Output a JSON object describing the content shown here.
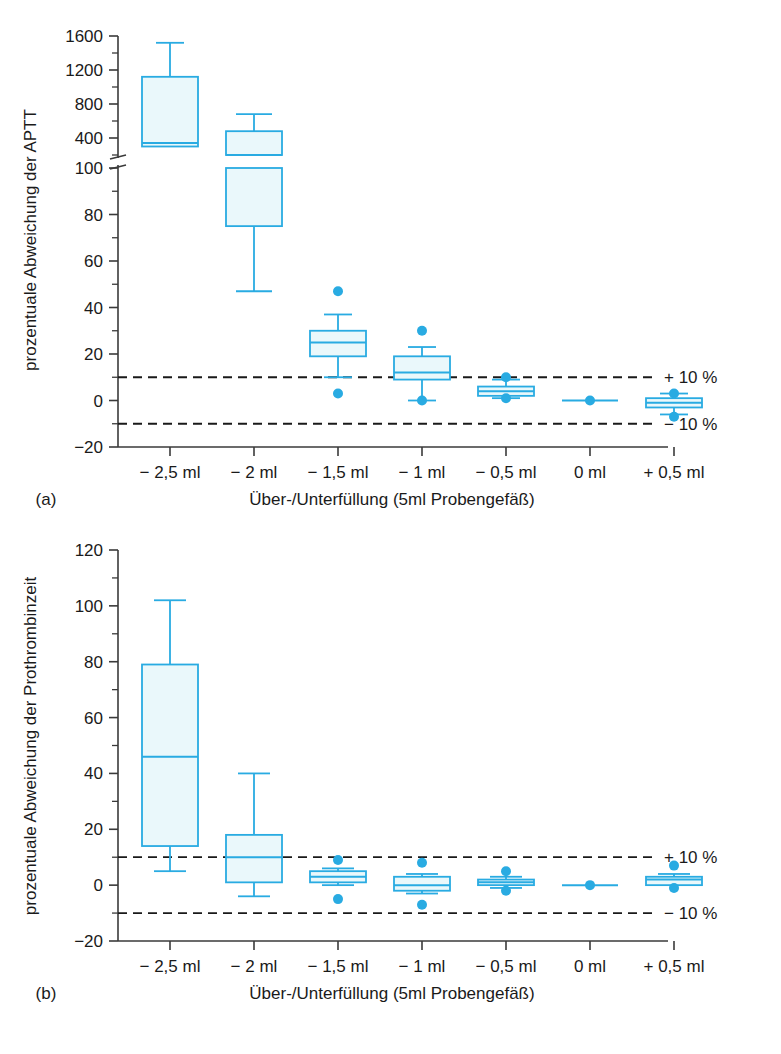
{
  "figure": {
    "panels": [
      {
        "key": "a",
        "label": "(a)"
      },
      {
        "key": "b",
        "label": "(b)"
      }
    ],
    "annotation_upper": "+ 10 %",
    "annotation_lower": "− 10 %",
    "accent_color": "#29ABE2",
    "box_fill": "#EAF8FB",
    "axis_color": "#3a3a3a",
    "dash_color": "#1a1a1a"
  },
  "chart_data": [
    {
      "type": "box",
      "panel": "a",
      "title": "",
      "xlabel": "Über-/Unterfüllung (5ml Probengefäß)",
      "ylabel": "prozentuale Abweichung der APTT",
      "categories": [
        "− 2,5 ml",
        "− 2 ml",
        "− 1,5 ml",
        "− 1 ml",
        "− 0,5 ml",
        "0 ml",
        "+ 0,5 ml"
      ],
      "ytick_labels": [
        "1600",
        "1200",
        "800",
        "400",
        "100",
        "80",
        "60",
        "40",
        "20",
        "0",
        "−20"
      ],
      "ytick_values": [
        1600,
        1200,
        800,
        400,
        100,
        80,
        60,
        40,
        20,
        0,
        -20
      ],
      "minor_ticks_upper": [
        1400,
        1000,
        600,
        200
      ],
      "minor_ticks_lower": [
        90,
        70,
        50,
        30,
        10,
        -10
      ],
      "broken_axis": true,
      "break_between": [
        200,
        100
      ],
      "ylim_upper": [
        200,
        1600
      ],
      "ylim_lower": [
        -20,
        100
      ],
      "grid": false,
      "reference_lines": [
        10,
        -10
      ],
      "reference_labels": [
        "+ 10 %",
        "− 10 %"
      ],
      "boxes": [
        {
          "category": "− 2,5 ml",
          "whisker_low": 300,
          "q1": 300,
          "median": 340,
          "q3": 1120,
          "whisker_high": 1520,
          "outliers": []
        },
        {
          "category": "− 2 ml",
          "whisker_low": 47,
          "q1": 75,
          "median": 200,
          "q3": 480,
          "whisker_high": 680,
          "outliers": []
        },
        {
          "category": "− 1,5 ml",
          "whisker_low": 10,
          "q1": 19,
          "median": 25,
          "q3": 30,
          "whisker_high": 37,
          "outliers": [
            47,
            3
          ]
        },
        {
          "category": "− 1 ml",
          "whisker_low": 0,
          "q1": 9,
          "median": 12,
          "q3": 19,
          "whisker_high": 23,
          "outliers": [
            30,
            0
          ]
        },
        {
          "category": "− 0,5 ml",
          "whisker_low": 1,
          "q1": 2,
          "median": 4,
          "q3": 6,
          "whisker_high": 9,
          "outliers": [
            10,
            1
          ]
        },
        {
          "category": "0 ml",
          "whisker_low": 0,
          "q1": 0,
          "median": 0,
          "q3": 0,
          "whisker_high": 0,
          "outliers": [
            0
          ]
        },
        {
          "category": "+ 0,5 ml",
          "whisker_low": -6,
          "q1": -3,
          "median": -1,
          "q3": 1,
          "whisker_high": 3,
          "outliers": [
            3,
            -7
          ]
        }
      ]
    },
    {
      "type": "box",
      "panel": "b",
      "title": "",
      "xlabel": "Über-/Unterfüllung (5ml Probengefäß)",
      "ylabel": "prozentuale Abweichung der Prothrombinzeit",
      "categories": [
        "− 2,5 ml",
        "− 2 ml",
        "− 1,5 ml",
        "− 1 ml",
        "− 0,5 ml",
        "0 ml",
        "+ 0,5 ml"
      ],
      "ytick_labels": [
        "120",
        "100",
        "80",
        "60",
        "40",
        "20",
        "0",
        "−20"
      ],
      "ytick_values": [
        120,
        100,
        80,
        60,
        40,
        20,
        0,
        -20
      ],
      "minor_ticks": [
        110,
        90,
        70,
        50,
        30,
        10,
        -10
      ],
      "broken_axis": false,
      "ylim": [
        -20,
        120
      ],
      "grid": false,
      "reference_lines": [
        10,
        -10
      ],
      "reference_labels": [
        "+ 10 %",
        "− 10 %"
      ],
      "boxes": [
        {
          "category": "− 2,5 ml",
          "whisker_low": 5,
          "q1": 14,
          "median": 46,
          "q3": 79,
          "whisker_high": 102,
          "outliers": []
        },
        {
          "category": "− 2 ml",
          "whisker_low": -4,
          "q1": 1,
          "median": 10,
          "q3": 18,
          "whisker_high": 40,
          "outliers": []
        },
        {
          "category": "− 1,5 ml",
          "whisker_low": 0,
          "q1": 1,
          "median": 3,
          "q3": 5,
          "whisker_high": 6,
          "outliers": [
            9,
            -5
          ]
        },
        {
          "category": "− 1 ml",
          "whisker_low": -3,
          "q1": -2,
          "median": 0,
          "q3": 3,
          "whisker_high": 4,
          "outliers": [
            8,
            -7
          ]
        },
        {
          "category": "− 0,5 ml",
          "whisker_low": -1,
          "q1": 0,
          "median": 1,
          "q3": 2,
          "whisker_high": 3,
          "outliers": [
            5,
            -2
          ]
        },
        {
          "category": "0 ml",
          "whisker_low": 0,
          "q1": 0,
          "median": 0,
          "q3": 0,
          "whisker_high": 0,
          "outliers": [
            0
          ]
        },
        {
          "category": "+ 0,5 ml",
          "whisker_low": 0,
          "q1": 0,
          "median": 2,
          "q3": 3,
          "whisker_high": 4,
          "outliers": [
            7,
            -1
          ]
        }
      ]
    }
  ]
}
